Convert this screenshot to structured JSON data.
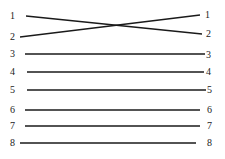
{
  "diagram": {
    "type": "pin-wiring-map",
    "line_color": "#1a1a1a",
    "label_color": "#222222",
    "background": "#ffffff",
    "wires": [
      {
        "id": "w1",
        "left_label": "1",
        "right_label": "2",
        "x1": 26,
        "y1": 16,
        "x2": 202,
        "y2": 34
      },
      {
        "id": "w2",
        "left_label": "2",
        "right_label": "1",
        "x1": 20,
        "y1": 37,
        "x2": 200,
        "y2": 15
      },
      {
        "id": "w3",
        "left_label": "3",
        "right_label": "3",
        "x1": 25,
        "y1": 54,
        "x2": 205,
        "y2": 54
      },
      {
        "id": "w4",
        "left_label": "4",
        "right_label": "4",
        "x1": 27,
        "y1": 72,
        "x2": 204,
        "y2": 72
      },
      {
        "id": "w5",
        "left_label": "5",
        "right_label": "5",
        "x1": 27,
        "y1": 90,
        "x2": 206,
        "y2": 90
      },
      {
        "id": "w6",
        "left_label": "6",
        "right_label": "6",
        "x1": 25,
        "y1": 110,
        "x2": 200,
        "y2": 110
      },
      {
        "id": "w7",
        "left_label": "7",
        "right_label": "7",
        "x1": 25,
        "y1": 126,
        "x2": 200,
        "y2": 126
      },
      {
        "id": "w8",
        "left_label": "8",
        "right_label": "8",
        "x1": 20,
        "y1": 143,
        "x2": 196,
        "y2": 143
      }
    ],
    "left_labels": [
      {
        "text": "1",
        "x": 10,
        "y": 19
      },
      {
        "text": "2",
        "x": 10,
        "y": 40
      },
      {
        "text": "3",
        "x": 10,
        "y": 57
      },
      {
        "text": "4",
        "x": 10,
        "y": 75
      },
      {
        "text": "5",
        "x": 10,
        "y": 93
      },
      {
        "text": "6",
        "x": 10,
        "y": 113
      },
      {
        "text": "7",
        "x": 10,
        "y": 129
      },
      {
        "text": "8",
        "x": 10,
        "y": 146
      }
    ],
    "right_labels": [
      {
        "text": "1",
        "x": 205,
        "y": 18
      },
      {
        "text": "2",
        "x": 206,
        "y": 37
      },
      {
        "text": "3",
        "x": 206,
        "y": 58
      },
      {
        "text": "4",
        "x": 206,
        "y": 75
      },
      {
        "text": "5",
        "x": 207,
        "y": 93
      },
      {
        "text": "6",
        "x": 207,
        "y": 113
      },
      {
        "text": "7",
        "x": 207,
        "y": 129
      },
      {
        "text": "8",
        "x": 207,
        "y": 146
      }
    ]
  }
}
